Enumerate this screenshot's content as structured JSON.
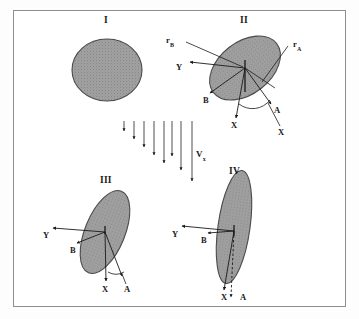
{
  "figure": {
    "border_color": "#8e8e8e",
    "background": "#ffffff",
    "ink_color": "#1a1a1a",
    "shape_fill": "#9c9c9c",
    "shape_stroke": "#4a4a4a"
  },
  "flow": {
    "label": "V",
    "label_sub": "x",
    "arrow_count": 8,
    "direction": "downward",
    "description": "velocity gradient profile, arrow length increases left to right"
  },
  "panels": [
    {
      "id": "I",
      "numeral": "I",
      "shape": "circle",
      "tilt_deg": 0,
      "aspect_ratio": 1.0,
      "labels": []
    },
    {
      "id": "II",
      "numeral": "II",
      "shape": "ellipse",
      "tilt_deg": -38,
      "aspect_ratio": 1.55,
      "labels": [
        "r_B",
        "Y",
        "B",
        "r_A",
        "X",
        "A",
        "X"
      ],
      "radius_a_label": "r",
      "radius_a_sub": "A",
      "radius_b_label": "r",
      "radius_b_sub": "B",
      "axis_y": "Y",
      "axis_x": "X",
      "body_a": "A",
      "body_b": "B",
      "body_x": "X"
    },
    {
      "id": "III",
      "numeral": "III",
      "shape": "ellipse",
      "tilt_deg": -22,
      "aspect_ratio": 2.4,
      "labels": [
        "Y",
        "B",
        "X",
        "A"
      ],
      "axis_y": "Y",
      "axis_x": "X",
      "body_a": "A",
      "body_b": "B"
    },
    {
      "id": "IV",
      "numeral": "IV",
      "shape": "ellipse",
      "tilt_deg": -8,
      "aspect_ratio": 3.6,
      "labels": [
        "Y",
        "B",
        "X",
        "A"
      ],
      "axis_y": "Y",
      "axis_x": "X",
      "body_a": "A",
      "body_b": "B"
    }
  ]
}
